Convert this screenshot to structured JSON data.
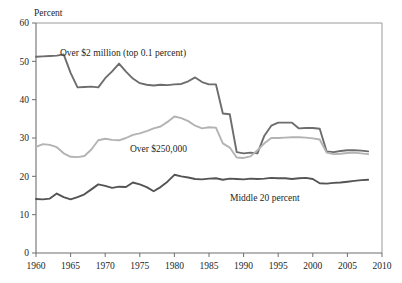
{
  "chart_data": {
    "type": "line",
    "title": "",
    "subtitle": "",
    "ylabel": "Percent",
    "xlabel": "",
    "xlim": [
      1960,
      2010
    ],
    "ylim": [
      0,
      60
    ],
    "grid": false,
    "legend_position": "inline-annotations",
    "y_ticks": [
      "0",
      "10",
      "20",
      "30",
      "40",
      "50",
      "60"
    ],
    "y_tick_values": [
      0,
      10,
      20,
      30,
      40,
      50,
      60
    ],
    "x_ticks": [
      "1960",
      "1965",
      "1970",
      "1975",
      "1980",
      "1985",
      "1990",
      "1995",
      "2000",
      "2005",
      "2010"
    ],
    "x_tick_values": [
      1960,
      1965,
      1970,
      1975,
      1980,
      1985,
      1990,
      1995,
      2000,
      2005,
      2010
    ],
    "x": [
      1960,
      1961,
      1962,
      1963,
      1964,
      1965,
      1966,
      1967,
      1968,
      1969,
      1970,
      1971,
      1972,
      1973,
      1974,
      1975,
      1976,
      1977,
      1978,
      1979,
      1980,
      1981,
      1982,
      1983,
      1984,
      1985,
      1986,
      1987,
      1988,
      1989,
      1990,
      1991,
      1992,
      1993,
      1994,
      1995,
      1996,
      1997,
      1998,
      1999,
      2000,
      2001,
      2002,
      2003,
      2004,
      2005,
      2006,
      2007,
      2008
    ],
    "series": [
      {
        "name": "Over $2 million (top 0.1 percent)",
        "color": "#6d6d6d",
        "width": 1.9,
        "annotation": "Over $2 million (top 0.1 percent)",
        "values": [
          51.2,
          51.3,
          51.4,
          51.5,
          51.8,
          47.0,
          43.2,
          43.3,
          43.4,
          43.2,
          45.6,
          47.4,
          49.4,
          47.3,
          45.5,
          44.3,
          43.9,
          43.7,
          43.9,
          43.8,
          44.0,
          44.1,
          44.8,
          45.8,
          44.6,
          44.0,
          44.0,
          36.4,
          36.2,
          26.3,
          26.0,
          26.2,
          26.0,
          30.6,
          33.2,
          34.0,
          34.0,
          34.0,
          32.5,
          32.6,
          32.6,
          32.4,
          26.5,
          26.3,
          26.6,
          26.8,
          26.8,
          26.7,
          26.5
        ]
      },
      {
        "name": "Over $250,000",
        "color": "#b3b3b3",
        "width": 1.9,
        "annotation": "Over $250,000",
        "values": [
          27.7,
          28.4,
          28.2,
          27.6,
          26.0,
          25.1,
          25.0,
          25.3,
          27.0,
          29.4,
          29.8,
          29.5,
          29.4,
          30.0,
          30.8,
          31.2,
          31.8,
          32.5,
          33.0,
          34.2,
          35.6,
          35.2,
          34.4,
          33.2,
          32.5,
          32.8,
          32.7,
          28.6,
          27.5,
          24.9,
          24.8,
          25.2,
          26.8,
          28.6,
          30.0,
          30.0,
          30.1,
          30.2,
          30.2,
          30.1,
          29.9,
          29.6,
          26.2,
          25.8,
          25.9,
          26.1,
          26.2,
          26.0,
          25.8
        ]
      },
      {
        "name": "Middle 20 percent",
        "color": "#545454",
        "width": 1.9,
        "annotation": "Middle 20 percent",
        "values": [
          14.1,
          14.0,
          14.2,
          15.5,
          14.6,
          14.0,
          14.6,
          15.3,
          16.6,
          17.9,
          17.5,
          17.0,
          17.3,
          17.2,
          18.4,
          17.9,
          17.2,
          16.1,
          17.2,
          18.6,
          20.4,
          20.0,
          19.7,
          19.3,
          19.2,
          19.4,
          19.5,
          19.1,
          19.4,
          19.3,
          19.2,
          19.4,
          19.3,
          19.4,
          19.6,
          19.5,
          19.5,
          19.3,
          19.5,
          19.6,
          19.3,
          18.2,
          18.1,
          18.3,
          18.4,
          18.6,
          18.8,
          19.0,
          19.1
        ]
      }
    ]
  },
  "layout": {
    "plot_left": 36,
    "plot_right": 382,
    "plot_top": 23,
    "plot_bottom": 253,
    "annotations": [
      {
        "text_key": "0",
        "x": 60,
        "y": 56
      },
      {
        "text_key": "1",
        "x": 130,
        "y": 152
      },
      {
        "text_key": "2",
        "x": 230,
        "y": 201
      }
    ]
  }
}
